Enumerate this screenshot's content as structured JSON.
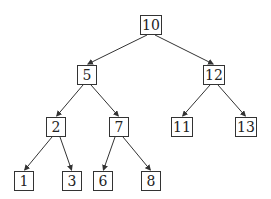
{
  "diagram": {
    "type": "binary-search-tree",
    "nodes": [
      {
        "id": "10",
        "label": "10",
        "x": 151,
        "y": 25,
        "w": 22
      },
      {
        "id": "5",
        "label": "5",
        "x": 87,
        "y": 75,
        "w": 20
      },
      {
        "id": "12",
        "label": "12",
        "x": 214,
        "y": 75,
        "w": 22
      },
      {
        "id": "2",
        "label": "2",
        "x": 56,
        "y": 127,
        "w": 20
      },
      {
        "id": "7",
        "label": "7",
        "x": 119,
        "y": 127,
        "w": 20
      },
      {
        "id": "11",
        "label": "11",
        "x": 182,
        "y": 127,
        "w": 22
      },
      {
        "id": "13",
        "label": "13",
        "x": 246,
        "y": 127,
        "w": 22
      },
      {
        "id": "1",
        "label": "1",
        "x": 24,
        "y": 181,
        "w": 20
      },
      {
        "id": "3",
        "label": "3",
        "x": 72,
        "y": 181,
        "w": 20
      },
      {
        "id": "6",
        "label": "6",
        "x": 103,
        "y": 181,
        "w": 20
      },
      {
        "id": "8",
        "label": "8",
        "x": 151,
        "y": 181,
        "w": 20
      }
    ],
    "edges": [
      [
        "10",
        "5"
      ],
      [
        "10",
        "12"
      ],
      [
        "5",
        "2"
      ],
      [
        "5",
        "7"
      ],
      [
        "12",
        "11"
      ],
      [
        "12",
        "13"
      ],
      [
        "2",
        "1"
      ],
      [
        "2",
        "3"
      ],
      [
        "7",
        "6"
      ],
      [
        "7",
        "8"
      ]
    ]
  }
}
